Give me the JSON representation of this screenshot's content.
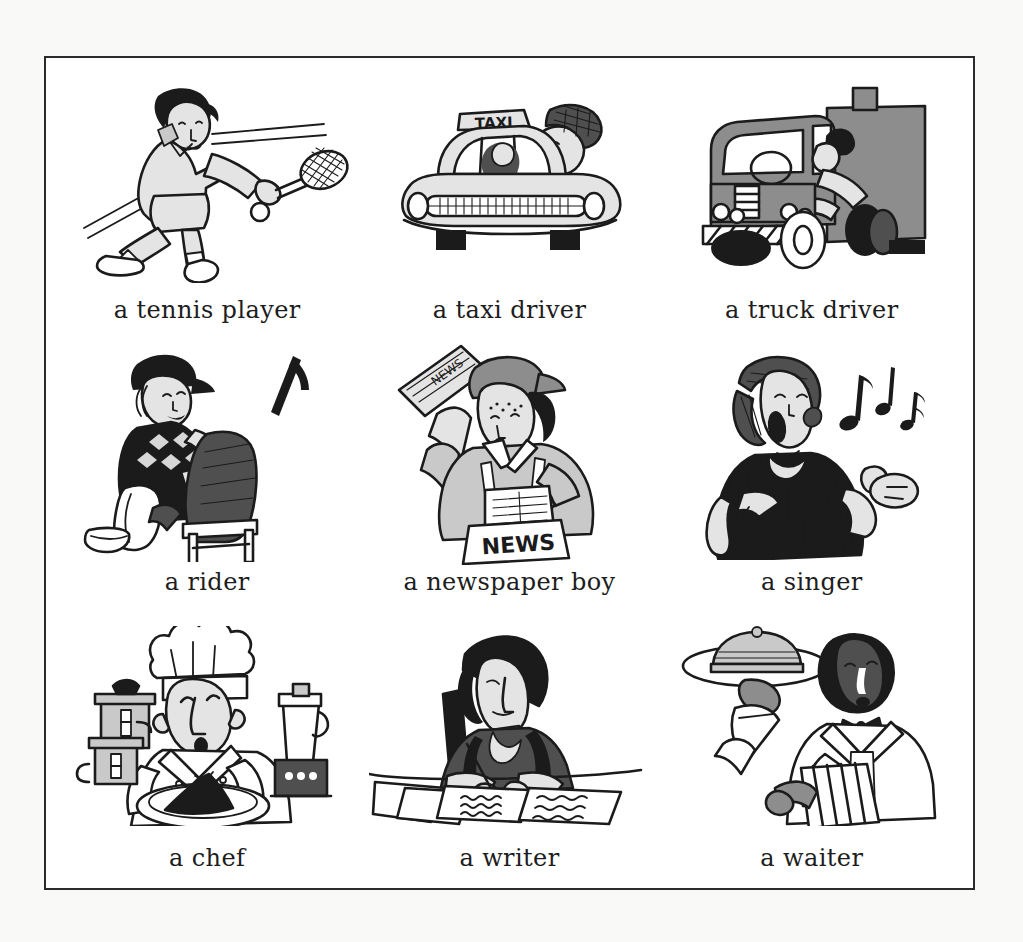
{
  "page": {
    "background_color": "#f9f9f7",
    "panel_color": "#ffffff",
    "border_color": "#2b2b2b",
    "ink_color": "#1b1b1b",
    "layout": {
      "columns": 3,
      "rows": 3
    }
  },
  "cells": [
    {
      "id": "tennis-player",
      "caption": "a tennis player",
      "illustration": "woman-playing-tennis-with-racket-and-ball",
      "embedded_text": ""
    },
    {
      "id": "taxi-driver",
      "caption": "a taxi driver",
      "illustration": "man-leaning-out-of-taxi-cab-window",
      "embedded_text": "TAXI"
    },
    {
      "id": "truck-driver",
      "caption": "a truck driver",
      "illustration": "driver-waving-from-cab-of-delivery-truck",
      "embedded_text": ""
    },
    {
      "id": "rider",
      "caption": "a rider",
      "illustration": "seated-rider-in-riding-cap-pulling-on-boots",
      "embedded_text": ""
    },
    {
      "id": "newspaper-boy",
      "caption": "a newspaper boy",
      "illustration": "boy-in-cap-waving-newspaper-with-news-bag",
      "embedded_text": "NEWS"
    },
    {
      "id": "singer",
      "caption": "a singer",
      "illustration": "woman-singing-with-musical-notes",
      "embedded_text": ""
    },
    {
      "id": "chef",
      "caption": "a chef",
      "illustration": "chef-in-toque-holding-platter-beside-pots-and-blender",
      "embedded_text": ""
    },
    {
      "id": "writer",
      "caption": "a writer",
      "illustration": "woman-writing-at-desk-with-papers",
      "embedded_text": ""
    },
    {
      "id": "waiter",
      "caption": "a waiter",
      "illustration": "waiter-carrying-covered-tray-with-napkin",
      "embedded_text": ""
    }
  ]
}
